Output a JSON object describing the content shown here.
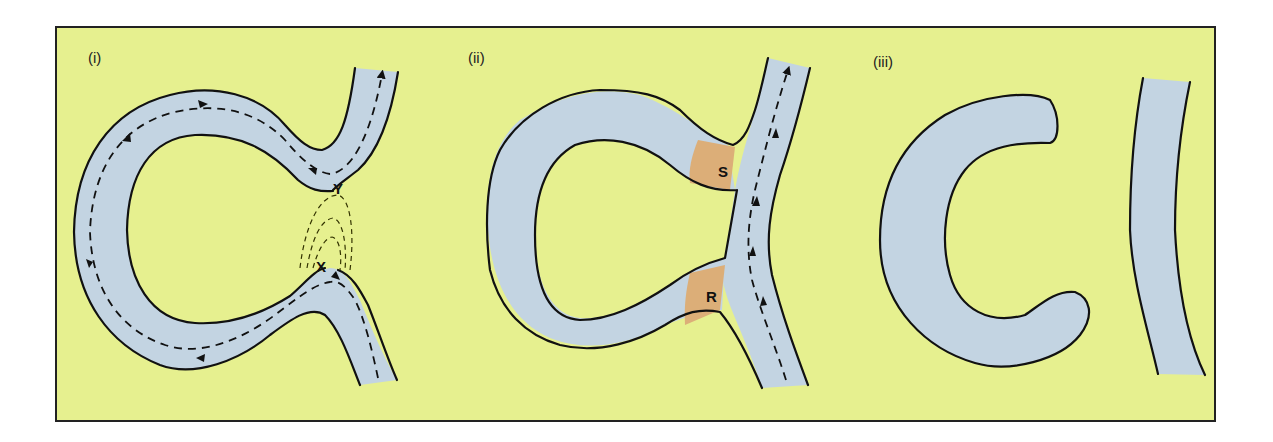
{
  "figure": {
    "colors": {
      "background": "#e6f08f",
      "river": "#c3d4e2",
      "bank_line": "#111111",
      "deposit": "#dcae78",
      "frame": "#222222"
    }
  },
  "panels": [
    {
      "id": "i",
      "label": "(i)",
      "points": [
        {
          "label": "Y",
          "description": "upper neck of meander"
        },
        {
          "label": "X",
          "description": "lower neck of meander"
        }
      ],
      "features": [
        "meander loop",
        "flow direction arrows (dashed)",
        "successive erosion lines between X and Y (dashed)"
      ]
    },
    {
      "id": "ii",
      "label": "(ii)",
      "points": [
        {
          "label": "S",
          "description": "deposition sealing upper end"
        },
        {
          "label": "R",
          "description": "deposition sealing lower end"
        }
      ],
      "features": [
        "neck cut through",
        "river flows straight",
        "deposits at S and R"
      ]
    },
    {
      "id": "iii",
      "label": "(iii)",
      "points": [],
      "features": [
        "oxbow lake separated",
        "straight river channel"
      ]
    }
  ]
}
